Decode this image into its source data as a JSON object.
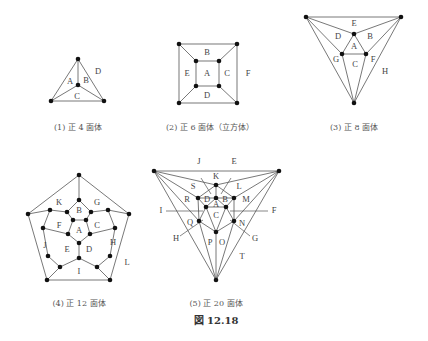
{
  "figure_caption": "図 12.18",
  "panels": [
    {
      "id": "tetra",
      "caption": "(1) 正 4 面体",
      "faces": {
        "A": "A",
        "B": "B",
        "C": "C",
        "D": "D"
      }
    },
    {
      "id": "cube",
      "caption": "(2) 正 6 面体（立方体）",
      "faces": {
        "A": "A",
        "B": "B",
        "C": "C",
        "D": "D",
        "E": "E",
        "F": "F"
      }
    },
    {
      "id": "octa",
      "caption": "(3) 正 8 面体",
      "faces": {
        "A": "A",
        "B": "B",
        "C": "C",
        "D": "D",
        "E": "E",
        "F": "F",
        "G": "G",
        "H": "H"
      }
    },
    {
      "id": "dodeca",
      "caption": "(4) 正 12 面体",
      "faces": {
        "A": "A",
        "B": "B",
        "C": "C",
        "D": "D",
        "E": "E",
        "F": "F",
        "G": "G",
        "H": "H",
        "I": "I",
        "J": "J",
        "K": "K",
        "L": "L"
      }
    },
    {
      "id": "icosa",
      "caption": "(5) 正 20 面体",
      "faces": {
        "A": "A",
        "B": "B",
        "C": "C",
        "D": "D",
        "E": "E",
        "F": "F",
        "G": "G",
        "H": "H",
        "I": "I",
        "J": "J",
        "K": "K",
        "L": "L",
        "M": "M",
        "N": "N",
        "O": "O",
        "P": "P",
        "Q": "Q",
        "R": "R",
        "S": "S",
        "T": "T"
      }
    }
  ]
}
